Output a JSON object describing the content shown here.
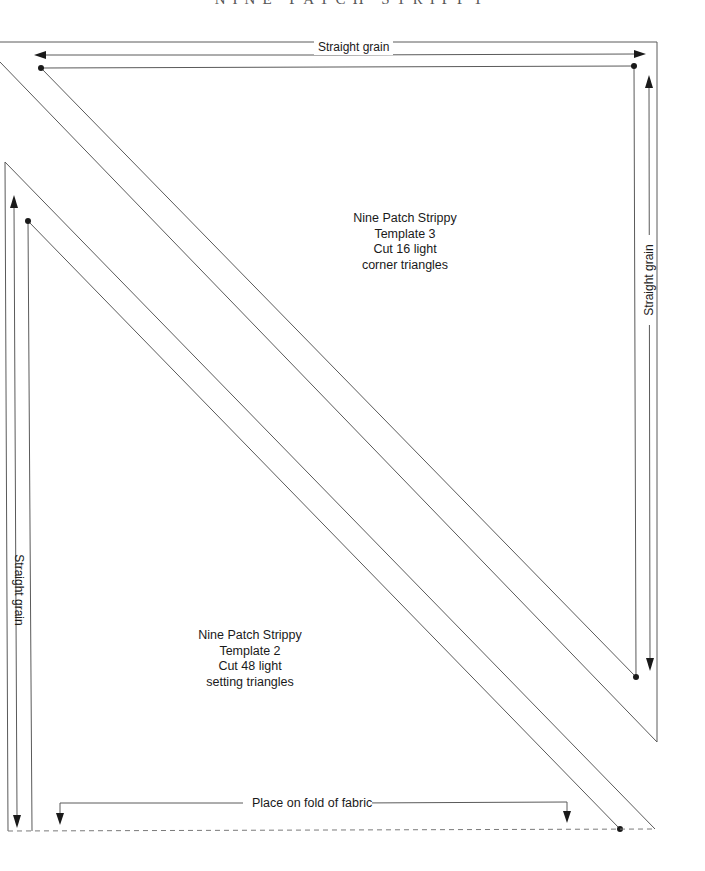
{
  "header": {
    "title": "NINE PATCH STRIPPY"
  },
  "grain_labels": {
    "top": "Straight grain",
    "right": "Straight grain",
    "left": "Straight grain"
  },
  "template_3": {
    "line1": "Nine Patch Strippy",
    "line2": "Template 3",
    "line3": "Cut 16 light",
    "line4": "corner triangles"
  },
  "template_2": {
    "line1": "Nine Patch Strippy",
    "line2": "Template 2",
    "line3": "Cut 48 light",
    "line4": "setting triangles"
  },
  "fold_label": "Place on fold of fabric",
  "colors": {
    "line": "#5a5a5a",
    "dashed": "#7a7a7a",
    "text": "#1a1a1a"
  }
}
